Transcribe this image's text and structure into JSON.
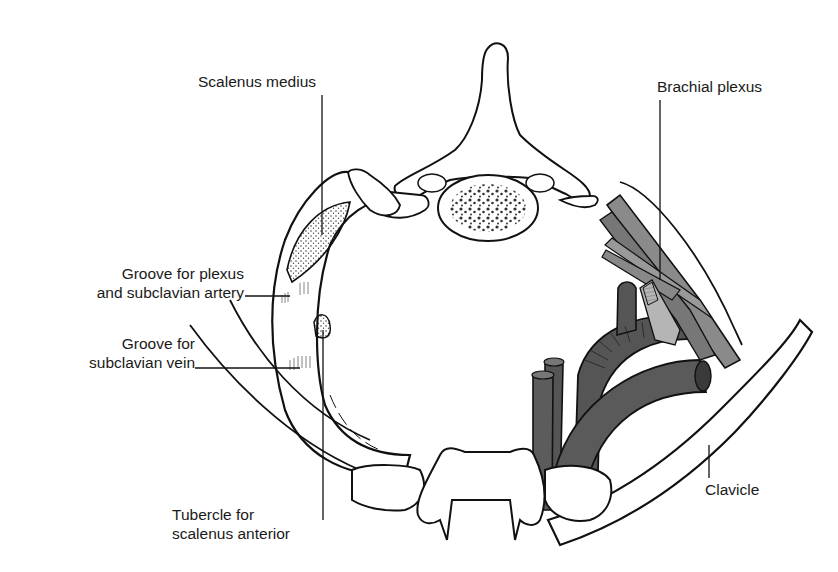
{
  "figure": {
    "colors": {
      "outline": "#111111",
      "bone_fill": "#ffffff",
      "vessel_dark": "#4a4a4a",
      "vessel_mid": "#6b6b6b",
      "nerve_gray": "#8a8a8a",
      "stipple": "#555555",
      "label_text": "#1a1a1a"
    }
  },
  "labels": {
    "scalenus_medius": "Scalenus medius",
    "brachial_plexus": "Brachial plexus",
    "groove_plexus_line1": "Groove for plexus",
    "groove_plexus_line2": "and subclavian artery",
    "groove_vein_line1": "Groove for",
    "groove_vein_line2": "subclavian vein",
    "tubercle_line1": "Tubercle for",
    "tubercle_line2": "scalenus anterior",
    "clavicle": "Clavicle"
  }
}
